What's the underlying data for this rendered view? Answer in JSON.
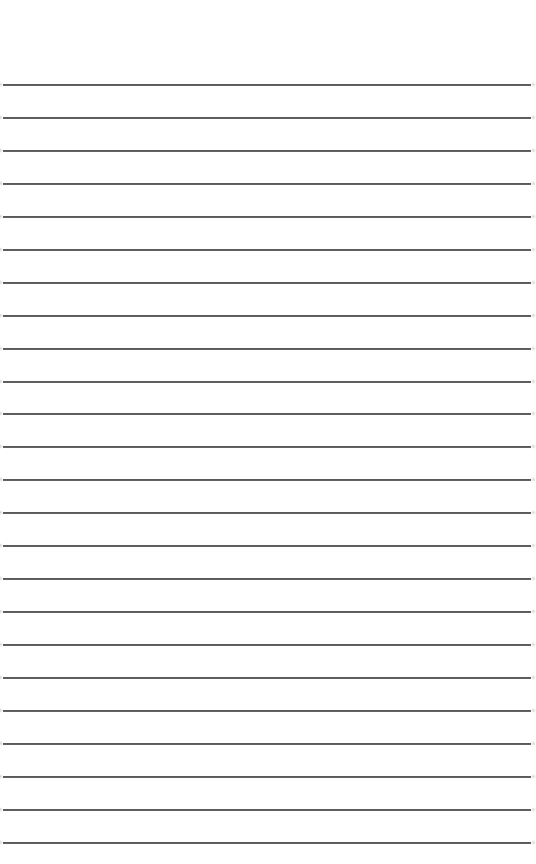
{
  "page": {
    "type": "lined-paper",
    "width": 536,
    "height": 864,
    "background_color": "#ffffff"
  },
  "rules": {
    "color": "#555555",
    "thickness_px": 1.5,
    "left_px": 3,
    "right_px": 531,
    "first_y": 84,
    "pitch_px": 33,
    "count": 24,
    "positions_y": [
      84,
      117,
      150,
      183,
      216,
      249,
      282,
      315,
      348,
      381,
      413,
      446,
      479,
      512,
      545,
      578,
      611,
      644,
      677,
      710,
      743,
      776,
      809,
      842
    ]
  }
}
